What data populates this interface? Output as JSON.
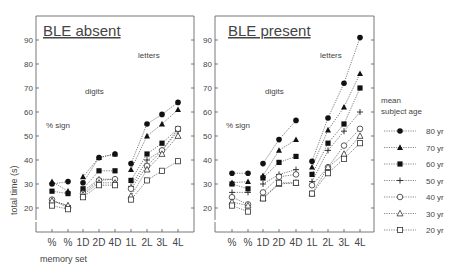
{
  "chart_data": [
    {
      "type": "line",
      "title": "BLE absent",
      "xlabel": "memory set",
      "ylabel": "total time (s)",
      "ylim": [
        12,
        98
      ],
      "yticks": [
        20,
        30,
        40,
        50,
        60,
        70,
        80,
        90
      ],
      "categories": [
        "%",
        "%",
        "1D",
        "2D",
        "4D",
        "1L",
        "2L",
        "3L",
        "4L"
      ],
      "annotations": [
        "% sign",
        "digits",
        "letters"
      ],
      "grid": false,
      "series": [
        {
          "name": "80 yr",
          "marker": "filled-circle",
          "values": [
            30,
            31,
            30.5,
            41,
            42.5,
            38.5,
            55,
            59,
            64
          ]
        },
        {
          "name": "70 yr",
          "marker": "filled-triangle",
          "values": [
            31,
            27,
            33,
            41,
            42.5,
            36,
            50,
            55,
            61
          ]
        },
        {
          "name": "60 yr",
          "marker": "filled-square",
          "values": [
            27,
            26,
            28,
            35.5,
            35.5,
            31.5,
            42.5,
            47,
            53
          ]
        },
        {
          "name": "50 yr",
          "marker": "plus",
          "values": [
            23,
            21,
            27,
            32,
            32,
            29,
            40,
            44,
            52
          ]
        },
        {
          "name": "40 yr",
          "marker": "open-circle",
          "values": [
            23.5,
            20,
            26,
            31.5,
            32,
            28,
            37.5,
            44,
            53
          ]
        },
        {
          "name": "30 yr",
          "marker": "open-triangle",
          "values": [
            23,
            21,
            25.5,
            30.5,
            30.5,
            25,
            36,
            42.5,
            50
          ]
        },
        {
          "name": "20 yr",
          "marker": "open-square",
          "values": [
            21,
            19.5,
            24.5,
            29.5,
            29.5,
            23.5,
            31.5,
            35.5,
            39.5
          ]
        }
      ]
    },
    {
      "type": "line",
      "title": "BLE present",
      "xlabel": "",
      "ylabel": "",
      "ylim": [
        12,
        98
      ],
      "yticks": [
        20,
        30,
        40,
        50,
        60,
        70,
        80,
        90
      ],
      "categories": [
        "%",
        "%",
        "1D",
        "2D",
        "4D",
        "1L",
        "2L",
        "3L",
        "4L"
      ],
      "annotations": [
        "% sign",
        "digits",
        "letters"
      ],
      "grid": false,
      "legend_title": "mean subject age",
      "legend_position": "right",
      "series": [
        {
          "name": "80 yr",
          "marker": "filled-circle",
          "values": [
            34.5,
            34.5,
            38.5,
            48.5,
            56.5,
            39.5,
            57.5,
            72,
            91
          ]
        },
        {
          "name": "70 yr",
          "marker": "filled-triangle",
          "values": [
            30.5,
            31,
            33.5,
            44,
            48.5,
            37,
            52.5,
            62,
            76
          ]
        },
        {
          "name": "60 yr",
          "marker": "filled-square",
          "values": [
            30,
            28,
            32.5,
            39,
            41.5,
            34,
            47,
            55,
            70
          ]
        },
        {
          "name": "50 yr",
          "marker": "plus",
          "values": [
            26.5,
            26.5,
            30,
            34,
            36,
            31,
            44,
            52,
            60
          ]
        },
        {
          "name": "40 yr",
          "marker": "open-circle",
          "values": [
            24.5,
            21.5,
            26.5,
            33,
            34,
            29.5,
            37,
            46,
            53
          ]
        },
        {
          "name": "30 yr",
          "marker": "open-triangle",
          "values": [
            22.5,
            21,
            24,
            30,
            30.5,
            26,
            37,
            42.5,
            50
          ]
        },
        {
          "name": "20 yr",
          "marker": "open-square",
          "values": [
            21,
            18.5,
            24,
            30.5,
            30.5,
            26,
            34.5,
            40.5,
            47
          ]
        }
      ]
    }
  ],
  "labels": {
    "panel_left_title": "BLE absent",
    "panel_right_title": "BLE present",
    "ylabel": "total time (s)",
    "xlabel": "memory set",
    "ann_percent": "% sign",
    "ann_digits": "digits",
    "ann_letters": "letters",
    "legend_title_1": "mean",
    "legend_title_2": "subject age"
  }
}
